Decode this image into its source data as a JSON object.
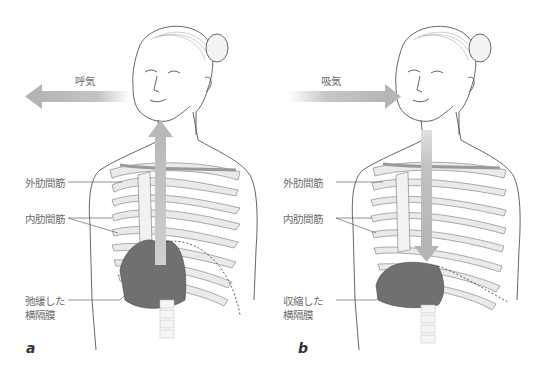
{
  "figure": {
    "panels": [
      {
        "id": "a",
        "letter": "a",
        "airflow_label": "呼気",
        "airflow_direction": "out",
        "labels": {
          "external_intercostal": "外肋間筋",
          "internal_intercostal": "内肋間筋",
          "diaphragm_line1": "弛緩した",
          "diaphragm_line2": "横隔膜"
        }
      },
      {
        "id": "b",
        "letter": "b",
        "airflow_label": "吸気",
        "airflow_direction": "in",
        "labels": {
          "external_intercostal": "外肋間筋",
          "internal_intercostal": "内肋間筋",
          "diaphragm_line1": "収縮した",
          "diaphragm_line2": "横隔膜"
        }
      }
    ],
    "colors": {
      "arrow": "#b8b8b8",
      "line_art": "#555555",
      "label_text": "#6b6b6b",
      "diaphragm": "#6e6e6e",
      "rib_fill": "#e6e6e6"
    }
  }
}
